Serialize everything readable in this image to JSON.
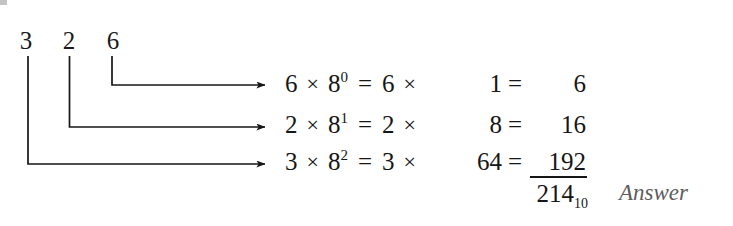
{
  "figure": {
    "type": "octal-to-decimal-positional-expansion",
    "background_color": "#ffffff",
    "ink_color": "#161616",
    "answer_color": "#5d5d5d",
    "octal_number": "326",
    "base": "8",
    "result_base_label": "10"
  },
  "source_digits": [
    {
      "label": "3",
      "position_weight": "8^2"
    },
    {
      "label": "2",
      "position_weight": "8^1"
    },
    {
      "label": "6",
      "position_weight": "8^0"
    }
  ],
  "rows": [
    {
      "digit": "6",
      "times1": "×",
      "base": "8",
      "exponent": "0",
      "equals1": "=",
      "factor": "6",
      "times2": "×",
      "power_value": "1",
      "equals2": "=",
      "result": "6"
    },
    {
      "digit": "2",
      "times1": "×",
      "base": "8",
      "exponent": "1",
      "equals1": "=",
      "factor": "2",
      "times2": "×",
      "power_value": "8",
      "equals2": "=",
      "result": "16"
    },
    {
      "digit": "3",
      "times1": "×",
      "base": "8",
      "exponent": "2",
      "equals1": "=",
      "factor": "3",
      "times2": "×",
      "power_value": "64",
      "equals2": "=",
      "result": "192"
    }
  ],
  "total": {
    "value": "214",
    "subscript": "10",
    "annotation": "Answer"
  },
  "connectors": [
    {
      "name": "connector-6",
      "from_digit": "6",
      "to_row": 0
    },
    {
      "name": "connector-2",
      "from_digit": "2",
      "to_row": 1
    },
    {
      "name": "connector-3",
      "from_digit": "3",
      "to_row": 2
    }
  ]
}
